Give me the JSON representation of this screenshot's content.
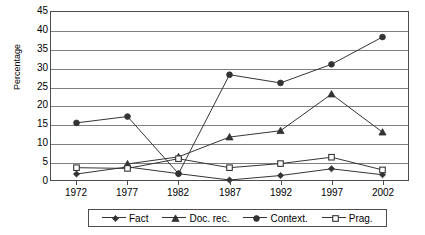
{
  "chart_data": {
    "type": "line",
    "title": "",
    "xlabel": "",
    "ylabel": "Percentage",
    "categories": [
      "1972",
      "1977",
      "1982",
      "1987",
      "1992",
      "1997",
      "2002"
    ],
    "ylim": [
      0,
      45
    ],
    "ytick_step": 5,
    "yticks": [
      "45",
      "40",
      "35",
      "30",
      "25",
      "20",
      "15",
      "10",
      "5",
      "0"
    ],
    "grid": true,
    "legend_position": "bottom",
    "series": [
      {
        "name": "Fact",
        "marker": "diamond",
        "color": "#333333",
        "values": [
          1.6,
          3.5,
          1.7,
          0.0,
          1.2,
          3.0,
          1.4
        ]
      },
      {
        "name": "Doc. rec.",
        "marker": "triangle",
        "color": "#333333",
        "values": [
          null,
          4.3,
          6.2,
          11.5,
          13.2,
          23.0,
          12.8
        ]
      },
      {
        "name": "Context.",
        "marker": "circle",
        "color": "#333333",
        "values": [
          15.3,
          17.0,
          1.7,
          28.2,
          26.0,
          31.0,
          38.3
        ]
      },
      {
        "name": "Prag.",
        "marker": "square-open",
        "color": "#333333",
        "values": [
          3.3,
          3.1,
          5.7,
          3.3,
          4.4,
          6.1,
          2.7
        ]
      }
    ]
  }
}
